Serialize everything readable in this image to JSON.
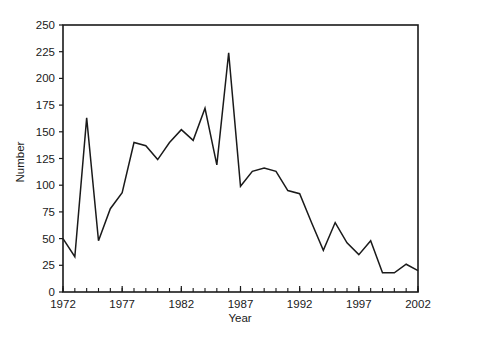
{
  "chart_data": {
    "type": "line",
    "title": "",
    "xlabel": "Year",
    "ylabel": "Number",
    "xlim": [
      1972,
      2002
    ],
    "ylim": [
      0,
      250
    ],
    "grid": false,
    "legend": null,
    "x_tick_labels": [
      "1972",
      "1977",
      "1982",
      "1987",
      "1992",
      "1997",
      "2002"
    ],
    "x_tick_values": [
      1972,
      1977,
      1982,
      1987,
      1992,
      1997,
      2002
    ],
    "x_minor_tick_step": 1,
    "y_tick_labels": [
      "0",
      "25",
      "50",
      "75",
      "100",
      "125",
      "150",
      "175",
      "200",
      "225",
      "250"
    ],
    "y_tick_values": [
      0,
      25,
      50,
      75,
      100,
      125,
      150,
      175,
      200,
      225,
      250
    ],
    "x": [
      1972,
      1973,
      1974,
      1975,
      1976,
      1977,
      1978,
      1979,
      1980,
      1981,
      1982,
      1983,
      1984,
      1985,
      1986,
      1987,
      1988,
      1989,
      1990,
      1991,
      1992,
      1993,
      1994,
      1995,
      1996,
      1997,
      1998,
      1999,
      2000,
      2001,
      2002
    ],
    "values": [
      50,
      33,
      163,
      48,
      78,
      93,
      140,
      137,
      124,
      140,
      152,
      142,
      172,
      119,
      224,
      99,
      113,
      116,
      113,
      95,
      92,
      65,
      39,
      65,
      46,
      35,
      48,
      18,
      18,
      26,
      20
    ],
    "series": [
      {
        "name": "Number",
        "color": "#1a1a1a",
        "values": [
          50,
          33,
          163,
          48,
          78,
          93,
          140,
          137,
          124,
          140,
          152,
          142,
          172,
          119,
          224,
          99,
          113,
          116,
          113,
          95,
          92,
          65,
          39,
          65,
          46,
          35,
          48,
          18,
          18,
          26,
          20
        ]
      }
    ],
    "annotations": []
  },
  "style": {
    "background": "#ffffff",
    "line_color": "#1a1a1a",
    "axis_color": "#1a1a1a"
  }
}
